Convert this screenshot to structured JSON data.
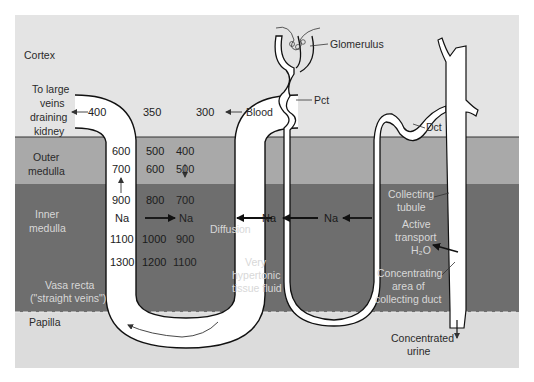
{
  "zones": {
    "cortex": {
      "label": "Cortex",
      "color": "#e4e4e4"
    },
    "outer_medulla": {
      "label_line1": "Outer",
      "label_line2": "medulla",
      "color": "#a9a9a9"
    },
    "inner_medulla": {
      "label_line1": "Inner",
      "label_line2": "medulla",
      "color": "#6e6e6e"
    },
    "papilla": {
      "label": "Papilla",
      "color": "#dcdcdc"
    }
  },
  "vasa_recta": {
    "label_line1": "Vasa recta",
    "label_line2": "(\"straight veins\")",
    "outflow_label": [
      "To large",
      "veins",
      "draining",
      "kidney"
    ],
    "inflow_label": "Blood",
    "descending_values": [
      "300",
      "400",
      "500",
      "700",
      "Na",
      "900",
      "1100"
    ],
    "middle_values": [
      "350",
      "500",
      "600",
      "800",
      "1000",
      "1200"
    ],
    "ascending_values": [
      "400",
      "600",
      "700",
      "900",
      "Na",
      "1100",
      "1300"
    ]
  },
  "nephron": {
    "glomerulus_label": "Glomerulus",
    "pct_label": "Pct",
    "dct_label": "Dct",
    "na_left": "Na",
    "na_right": "Na",
    "diffusion_label": "Diffusion"
  },
  "tissue": {
    "line1": "Very",
    "line2": "hypertonic",
    "line3": "tissue fluid"
  },
  "collecting_duct": {
    "tubule_line1": "Collecting",
    "tubule_line2": "tubule",
    "active_line1": "Active",
    "active_line2": "transport",
    "h2o": "H₂O",
    "conc_line1": "Concentrating",
    "conc_line2": "area of",
    "conc_line3": "collecting duct",
    "urine_line1": "Concentrated",
    "urine_line2": "urine"
  }
}
